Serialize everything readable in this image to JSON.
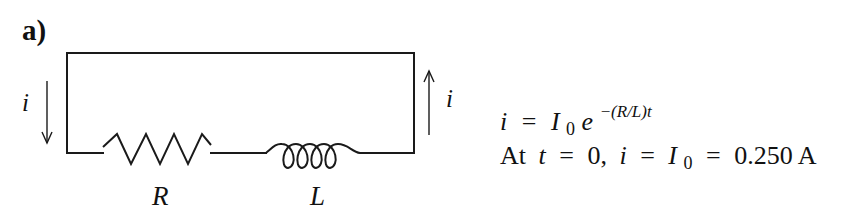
{
  "figure": {
    "part_label": "a)",
    "colors": {
      "line": "#1a1a1a",
      "text": "#111111",
      "background": "#ffffff"
    }
  },
  "circuit": {
    "components": [
      {
        "type": "resistor",
        "label": "R"
      },
      {
        "type": "inductor",
        "label": "L"
      }
    ],
    "current_arrows": [
      {
        "side": "left",
        "direction": "down",
        "label": "i"
      },
      {
        "side": "right",
        "direction": "up",
        "label": "i"
      }
    ]
  },
  "equations": {
    "line1": {
      "lhs": "i",
      "eq": "=",
      "base": "I",
      "base_sub": "0",
      "exp_base": "e",
      "exponent": "−(R/L)t"
    },
    "line2": {
      "prefix": "At",
      "var_t": "t",
      "eq1": "=",
      "t_value": "0,",
      "var_i": "i",
      "eq2": "=",
      "I": "I",
      "I_sub": "0",
      "eq3": "=",
      "value": "0.250 A"
    }
  }
}
